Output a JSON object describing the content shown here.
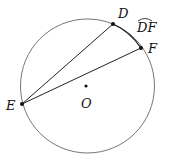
{
  "diagram": {
    "circle": {
      "center_label": "O"
    },
    "points": {
      "D": {
        "label": "D"
      },
      "E": {
        "label": "E"
      },
      "F": {
        "label": "F"
      }
    },
    "arc_label": "DF",
    "segments": [
      "ED",
      "EF"
    ],
    "colors": {
      "stroke": "#555555",
      "chord": "#222222",
      "point": "#111111"
    }
  }
}
